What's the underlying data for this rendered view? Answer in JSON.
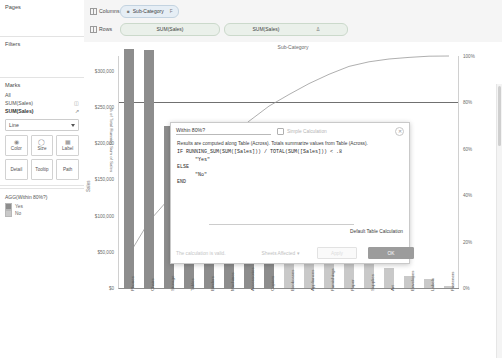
{
  "sidebar": {
    "pages_label": "Pages",
    "filters_label": "Filters",
    "marks": {
      "title": "Marks",
      "all_label": "All",
      "fields": [
        {
          "label": "SUM(Sales)",
          "icon": "bar-chart-icon"
        },
        {
          "label": "SUM(Sales)",
          "icon": "line-chart-icon"
        }
      ],
      "mark_type": "Line",
      "cards": [
        {
          "label": "Color",
          "icon": "color-icon"
        },
        {
          "label": "Size",
          "icon": "size-icon"
        },
        {
          "label": "Label",
          "icon": "label-icon"
        },
        {
          "label": "Detail",
          "icon": "detail-icon"
        },
        {
          "label": "Tooltip",
          "icon": "tooltip-icon"
        },
        {
          "label": "Path",
          "icon": "path-icon"
        }
      ]
    },
    "legend": {
      "title": "AGG(Within 80%?)",
      "items": [
        {
          "label": "Yes",
          "color": "#8d8d8d"
        },
        {
          "label": "No",
          "color": "#c9c9c9"
        }
      ]
    }
  },
  "shelves": {
    "columns_label": "Columns",
    "rows_label": "Rows",
    "columns_pills": [
      {
        "label": "Sub-Category",
        "sort": "F"
      }
    ],
    "rows_pills": [
      {
        "label": "SUM(Sales)"
      },
      {
        "label": "SUM(Sales)",
        "badge": "Δ"
      }
    ]
  },
  "dialog": {
    "title": "Within 80%?",
    "simple_calc_label": "Simple  Calculation",
    "close_icon": "close-icon",
    "note": "Results are computed along Table (Across).  Totals summarize values from Table (Across).",
    "code": "IF RUNNING_SUM(SUM([Sales])) / TOTAL(SUM([Sales])) < .8\n      \"Yes\"\nELSE\n      \"No\"\nEND",
    "default_table_calculation": "Default Table Calculation",
    "valid_text": "The calculation is valid.",
    "sheets_affected": "Sheets Affected",
    "apply_label": "Apply",
    "ok_label": "OK"
  },
  "chart_data": {
    "type": "bar",
    "title": "Sub-Category",
    "xlabel": "",
    "ylabel": "Sales",
    "y2label": "% of Total Running Sum of Sales",
    "ylim": [
      0,
      320000
    ],
    "y2lim": [
      0,
      100
    ],
    "yticks": [
      "$0",
      "$50,000",
      "$100,000",
      "$150,000",
      "$200,000",
      "$250,000",
      "$300,000"
    ],
    "ytick_values": [
      0,
      50000,
      100000,
      150000,
      200000,
      250000,
      300000
    ],
    "y2ticks": [
      "0%",
      "20%",
      "40%",
      "60%",
      "80%",
      "100%"
    ],
    "y2tick_values": [
      0,
      20,
      40,
      60,
      80,
      100
    ],
    "reference_line": {
      "label": "80%",
      "value": 80
    },
    "grid": false,
    "legend_position": "sidebar",
    "categories": [
      "Phones",
      "Chairs",
      "Storage",
      "Tables",
      "Binders",
      "Machines",
      "Accessories",
      "Copiers",
      "Bookcases",
      "Appliances",
      "Furnishings",
      "Paper",
      "Supplies",
      "Art",
      "Envelopes",
      "Labels",
      "Fasteners"
    ],
    "series": [
      {
        "name": "SUM(Sales)",
        "type": "bar",
        "values": [
          330007,
          328449,
          223844,
          206966,
          203413,
          189239,
          167380,
          149528,
          114880,
          107532,
          91705,
          78479,
          46674,
          27119,
          16476,
          12486,
          3024
        ]
      },
      {
        "name": "% of Total Running Sum of Sales",
        "type": "line",
        "values": [
          14.4,
          28.7,
          38.5,
          47.5,
          56.3,
          64.6,
          71.9,
          78.4,
          83.4,
          88.1,
          92.1,
          95.5,
          97.5,
          98.7,
          99.4,
          99.9,
          100.0
        ]
      }
    ],
    "within_80_flags": [
      "Yes",
      "Yes",
      "Yes",
      "Yes",
      "Yes",
      "Yes",
      "Yes",
      "Yes",
      "No",
      "No",
      "No",
      "No",
      "No",
      "No",
      "No",
      "No",
      "No"
    ]
  }
}
